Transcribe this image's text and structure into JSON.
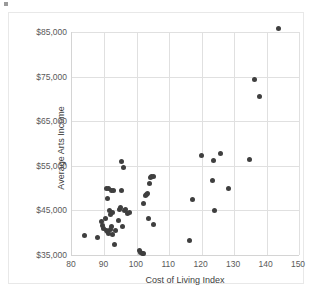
{
  "chart_data": {
    "type": "scatter",
    "title": "",
    "xlabel": "Cost of Living Index",
    "ylabel": "Average Arts Income",
    "xlim": [
      80,
      150
    ],
    "ylim": [
      35000,
      85000
    ],
    "xticks": [
      80,
      90,
      100,
      110,
      120,
      130,
      140,
      150
    ],
    "xtick_labels": [
      "80",
      "90",
      "100",
      "110",
      "120",
      "130",
      "140",
      "150"
    ],
    "yticks": [
      35000,
      45000,
      55000,
      65000,
      75000,
      85000
    ],
    "ytick_labels": [
      "$35,000",
      "$45,000",
      "$55,000",
      "$65,000",
      "$75,000",
      "$85,000"
    ],
    "grid": true,
    "legend": null,
    "marker": {
      "shape": "circle",
      "color": "#3f3f3f",
      "size": 5
    },
    "series": [
      {
        "name": "Cities",
        "points": [
          [
            83.8,
            39300
          ],
          [
            87.9,
            38900
          ],
          [
            89.1,
            42600
          ],
          [
            89.4,
            41600
          ],
          [
            89.8,
            41000
          ],
          [
            90.2,
            43100
          ],
          [
            90.5,
            40500
          ],
          [
            90.7,
            49800
          ],
          [
            90.9,
            40200
          ],
          [
            91.0,
            47600
          ],
          [
            91.2,
            50000
          ],
          [
            91.4,
            39900
          ],
          [
            91.6,
            45000
          ],
          [
            91.8,
            44100
          ],
          [
            91.9,
            40800
          ],
          [
            92.1,
            49400
          ],
          [
            92.3,
            41300
          ],
          [
            92.4,
            39700
          ],
          [
            92.6,
            44500
          ],
          [
            92.8,
            49500
          ],
          [
            93.0,
            37400
          ],
          [
            93.3,
            40600
          ],
          [
            94.2,
            42700
          ],
          [
            94.6,
            45200
          ],
          [
            94.9,
            45600
          ],
          [
            95.2,
            49400
          ],
          [
            95.4,
            56000
          ],
          [
            95.7,
            41300
          ],
          [
            95.9,
            54600
          ],
          [
            96.2,
            44900
          ],
          [
            96.5,
            45100
          ],
          [
            97.1,
            44200
          ],
          [
            97.6,
            44500
          ],
          [
            100.9,
            36000
          ],
          [
            101.2,
            35500
          ],
          [
            101.6,
            35300
          ],
          [
            101.9,
            35300
          ],
          [
            102.2,
            46500
          ],
          [
            102.6,
            48300
          ],
          [
            102.9,
            48600
          ],
          [
            103.2,
            48900
          ],
          [
            103.5,
            43200
          ],
          [
            103.8,
            51000
          ],
          [
            104.2,
            52400
          ],
          [
            104.6,
            52700
          ],
          [
            105.0,
            52600
          ],
          [
            105.2,
            41800
          ],
          [
            116.1,
            38200
          ],
          [
            117.3,
            47400
          ],
          [
            120.0,
            57200
          ],
          [
            123.2,
            51700
          ],
          [
            123.6,
            56300
          ],
          [
            124.0,
            45000
          ],
          [
            125.8,
            57800
          ],
          [
            128.4,
            49900
          ],
          [
            134.8,
            56400
          ],
          [
            136.2,
            74400
          ],
          [
            137.8,
            70600
          ],
          [
            143.6,
            85800
          ]
        ]
      }
    ]
  },
  "axis_titles": {
    "x": "Cost of Living Index",
    "y": "Average Arts Income"
  }
}
